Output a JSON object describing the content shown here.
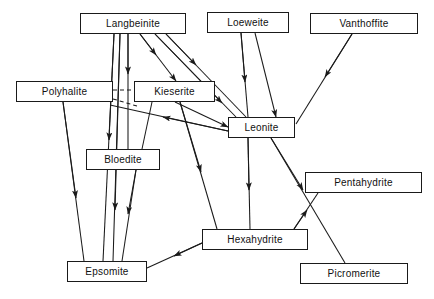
{
  "diagram": {
    "type": "directed-graph",
    "background_color": "#ffffff",
    "line_color": "#1a1a1a",
    "text_color": "#111111",
    "nodes": [
      {
        "id": "langbeinite",
        "label": "Langbeinite",
        "x": 80,
        "y": 13,
        "w": 106,
        "h": 21
      },
      {
        "id": "loeweite",
        "label": "Loeweite",
        "x": 207,
        "y": 12,
        "w": 82,
        "h": 21
      },
      {
        "id": "vanthoffite",
        "label": "Vanthoffite",
        "x": 310,
        "y": 13,
        "w": 108,
        "h": 21
      },
      {
        "id": "polyhalite",
        "label": "Polyhalite",
        "x": 16,
        "y": 81,
        "w": 97,
        "h": 21
      },
      {
        "id": "kieserite",
        "label": "Kieserite",
        "x": 134,
        "y": 81,
        "w": 81,
        "h": 21
      },
      {
        "id": "leonite",
        "label": "Leonite",
        "x": 228,
        "y": 117,
        "w": 67,
        "h": 21
      },
      {
        "id": "bloedite",
        "label": "Bloedite",
        "x": 86,
        "y": 149,
        "w": 74,
        "h": 21
      },
      {
        "id": "pentahydrite",
        "label": "Pentahydrite",
        "x": 305,
        "y": 172,
        "w": 117,
        "h": 21
      },
      {
        "id": "hexahydrite",
        "label": "Hexahydrite",
        "x": 202,
        "y": 229,
        "w": 106,
        "h": 21
      },
      {
        "id": "epsomite",
        "label": "Epsomite",
        "x": 67,
        "y": 261,
        "w": 80,
        "h": 21
      },
      {
        "id": "picromerite",
        "label": "Picromerite",
        "x": 300,
        "y": 263,
        "w": 108,
        "h": 21
      }
    ],
    "edges": [
      {
        "id": "langbeinite-bloedite",
        "from": "langbeinite",
        "to": "bloedite",
        "style": "solid",
        "arrow": "end"
      },
      {
        "id": "langbeinite-epsomite-a",
        "from": "langbeinite",
        "to": "epsomite",
        "style": "solid",
        "arrow": "end"
      },
      {
        "id": "langbeinite-epsomite-b",
        "from": "langbeinite",
        "to": "epsomite",
        "style": "solid",
        "arrow": "end"
      },
      {
        "id": "langbeinite-kieserite",
        "from": "langbeinite",
        "to": "kieserite",
        "style": "solid",
        "arrow": "end"
      },
      {
        "id": "langbeinite-leonite-a",
        "from": "langbeinite",
        "to": "leonite",
        "style": "solid",
        "arrow": "end"
      },
      {
        "id": "langbeinite-leonite-b",
        "from": "langbeinite",
        "to": "leonite",
        "style": "solid",
        "arrow": "end"
      },
      {
        "id": "loeweite-leonite-a",
        "from": "loeweite",
        "to": "leonite",
        "style": "solid",
        "arrow": "end"
      },
      {
        "id": "loeweite-leonite-b",
        "from": "loeweite",
        "to": "leonite",
        "style": "solid",
        "arrow": "end"
      },
      {
        "id": "vanthoffite-leonite",
        "from": "vanthoffite",
        "to": "leonite",
        "style": "solid",
        "arrow": "end"
      },
      {
        "id": "polyhalite-kieserite",
        "from": "polyhalite",
        "to": "kieserite",
        "style": "dashed",
        "arrow": "none"
      },
      {
        "id": "polyhalite-leonite",
        "from": "polyhalite",
        "to": "leonite",
        "style": "dashed",
        "arrow": "none"
      },
      {
        "id": "polyhalite-epsomite",
        "from": "polyhalite",
        "to": "epsomite",
        "style": "solid",
        "arrow": "end"
      },
      {
        "id": "kieserite-leonite",
        "from": "kieserite",
        "to": "leonite",
        "style": "solid",
        "arrow": "end"
      },
      {
        "id": "kieserite-bloedite",
        "from": "kieserite",
        "to": "bloedite",
        "style": "solid",
        "arrow": "none"
      },
      {
        "id": "kieserite-hexahydrite",
        "from": "kieserite",
        "to": "hexahydrite",
        "style": "solid",
        "arrow": "end"
      },
      {
        "id": "leonite-kieserite",
        "from": "leonite",
        "to": "kieserite",
        "style": "solid",
        "arrow": "end"
      },
      {
        "id": "leonite-hexahydrite",
        "from": "leonite",
        "to": "hexahydrite",
        "style": "solid",
        "arrow": "end"
      },
      {
        "id": "leonite-picromerite",
        "from": "leonite",
        "to": "picromerite",
        "style": "solid",
        "arrow": "end"
      },
      {
        "id": "bloedite-epsomite",
        "from": "bloedite",
        "to": "epsomite",
        "style": "solid",
        "arrow": "end"
      },
      {
        "id": "hexahydrite-epsomite",
        "from": "hexahydrite",
        "to": "epsomite",
        "style": "solid",
        "arrow": "end"
      },
      {
        "id": "hexahydrite-pentahydrite",
        "from": "hexahydrite",
        "to": "pentahydrite",
        "style": "solid",
        "arrow": "end"
      }
    ]
  }
}
